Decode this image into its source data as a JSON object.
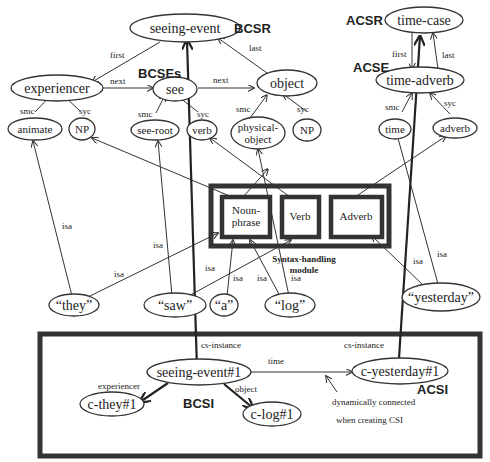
{
  "diagram": {
    "region_labels": {
      "bcsr": "BCSR",
      "bcses": "BCSEs",
      "acsr": "ACSR",
      "acse": "ACSE",
      "bcsi": "BCSI",
      "acsi": "ACSI",
      "syntax_module_line1": "Syntax-handling",
      "syntax_module_line2": "module"
    },
    "nodes": {
      "seeing_event": "seeing-event",
      "experiencer": "experiencer",
      "see": "see",
      "object": "object",
      "animate": "animate",
      "np1": "NP",
      "see_root": "see-root",
      "verb": "verb",
      "physical_object_1": "physical-",
      "physical_object_2": "object",
      "np2": "NP",
      "time_case": "time-case",
      "time_adverb": "time-adverb",
      "time": "time",
      "adverb": "adverb",
      "they": "“they”",
      "saw": "“saw”",
      "a": "“a”",
      "log": "“log”",
      "yesterday": "“yesterday”",
      "seeing_event_1": "seeing-event#1",
      "c_they_1": "c-they#1",
      "c_log_1": "c-log#1",
      "c_yesterday_1": "c-yesterday#1"
    },
    "syntax_boxes": {
      "noun_phrase_1": "Noun-",
      "noun_phrase_2": "phrase",
      "verb": "Verb",
      "adverb": "Adverb"
    },
    "edge_labels": {
      "first": "first",
      "last": "last",
      "next_1": "next",
      "next_2": "next",
      "smc_1": "smc",
      "syc_1": "syc",
      "smc_2": "smc",
      "syc_2": "syc",
      "smc_3": "smc",
      "syc_3": "syc",
      "acsr_first": "first",
      "acsr_last": "last",
      "smc_4": "smc",
      "syc_4": "syc",
      "isa_they_animate": "isa",
      "isa_they_np": "isa",
      "isa_saw_root": "isa",
      "isa_saw_verb": "isa",
      "isa_a": "isa",
      "isa_log_np": "isa",
      "isa_log_phys": "isa",
      "isa_yest_adverb": "isa",
      "isa_yest_time": "isa",
      "cs_instance_1": "cs-instance",
      "cs_instance_2": "cs-instance",
      "time": "time",
      "experiencer": "experiencer",
      "object": "object"
    },
    "annotation": {
      "line1": "dynamically connected",
      "line2": "when creating CSI"
    }
  }
}
